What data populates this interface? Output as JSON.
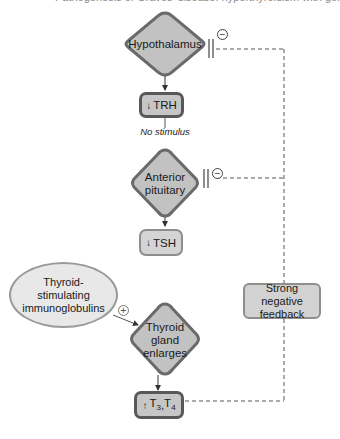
{
  "diagram": {
    "caption_cut": "Pathogenesis of Graves' disease: hyperthyroidism with goiter",
    "nodes": {
      "hypothalamus": {
        "label": "Hypothalamus",
        "shape": "diamond"
      },
      "trh": {
        "arrow": "↓",
        "label": "TRH",
        "shape": "rounded-box"
      },
      "no_stimulus": {
        "label": "No stimulus"
      },
      "anterior_pituitary": {
        "line1": "Anterior",
        "line2": "pituitary",
        "shape": "diamond"
      },
      "tsh": {
        "arrow": "↓",
        "label": "TSH",
        "shape": "rounded-box"
      },
      "tsi": {
        "line1": "Thyroid-",
        "line2": "stimulating",
        "line3": "immunoglobulins",
        "shape": "ellipse"
      },
      "thyroid": {
        "line1": "Thyroid",
        "line2": "gland",
        "line3": "enlarges",
        "shape": "diamond"
      },
      "t3t4": {
        "arrow": "↑",
        "t3": "T",
        "t3_sub": "3",
        "sep": ", ",
        "t4": "T",
        "t4_sub": "4",
        "shape": "rounded-box"
      },
      "feedback": {
        "line1": "Strong negative",
        "line2": "feedback",
        "shape": "rounded-box"
      }
    },
    "symbols": {
      "inhibit": "−",
      "stimulate": "+"
    },
    "colors": {
      "node_fill": "#c6c6c6",
      "node_border_dark": "#585858",
      "node_border_light": "#8e8e8e",
      "ellipse_fill": "#e8e8e8",
      "line": "#555555"
    }
  }
}
